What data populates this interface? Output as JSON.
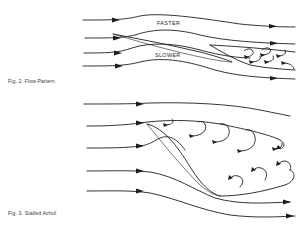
{
  "figures": [
    {
      "id": "fig2",
      "caption": "Fig. 2. Flow Pattern",
      "labels": {
        "upper": "FASTER",
        "lower": "SLOWER"
      },
      "streamlines": 4,
      "wake_vortices": 6
    },
    {
      "id": "fig3",
      "caption": "Fig. 3. Stalled Airfoil",
      "streamlines": 5,
      "upper_vortices": 5,
      "lower_vortices": 3
    }
  ],
  "colors": {
    "ink": "#1e1e1e",
    "caption_text": "#3a3a3a",
    "background": "#ffffff"
  }
}
